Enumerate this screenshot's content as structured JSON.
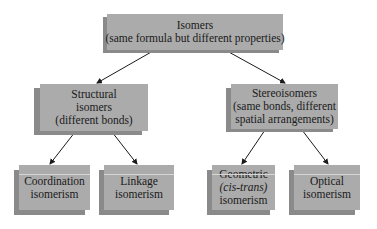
{
  "diagram": {
    "type": "tree",
    "root": {
      "id": "isomers",
      "lines": [
        "Isomers",
        "(same formula but different properties)"
      ]
    },
    "level2": [
      {
        "id": "structural",
        "lines": [
          "Structural",
          "isomers",
          "(different bonds)"
        ]
      },
      {
        "id": "stereo",
        "lines": [
          "Stereoisomers",
          "(same bonds, different",
          "spatial arrangements)"
        ]
      }
    ],
    "level3": [
      {
        "id": "coordination",
        "parent": "structural",
        "lines": [
          "Coordination",
          "isomerism"
        ]
      },
      {
        "id": "linkage",
        "parent": "structural",
        "lines": [
          "Linkage",
          "isomerism"
        ]
      },
      {
        "id": "geometric",
        "parent": "stereo",
        "lines": [
          "Geometric",
          "(cis-trans)",
          "isomerism"
        ]
      },
      {
        "id": "optical",
        "parent": "stereo",
        "lines": [
          "Optical",
          "isomerism"
        ]
      }
    ],
    "edges": [
      [
        "isomers",
        "structural"
      ],
      [
        "isomers",
        "stereo"
      ],
      [
        "structural",
        "coordination"
      ],
      [
        "structural",
        "linkage"
      ],
      [
        "stereo",
        "geometric"
      ],
      [
        "stereo",
        "optical"
      ]
    ],
    "colors": {
      "box": "#ababab",
      "shadow": "#8a8a8a",
      "arrow": "#1a1a1a",
      "background": "#ffffff"
    }
  }
}
